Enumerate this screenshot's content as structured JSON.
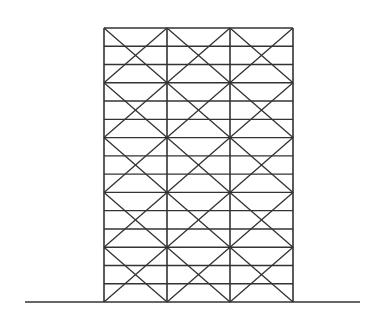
{
  "diagram": {
    "type": "braced-frame-elevation",
    "stroke_color": "#333333",
    "background": "#ffffff",
    "frame": {
      "left": 104,
      "right": 293,
      "top": 28,
      "bottom": 302,
      "bays": 3,
      "stories": 15,
      "brace_module_stories": 3
    },
    "ground": {
      "x1": 25,
      "x2": 360,
      "y": 302
    }
  }
}
